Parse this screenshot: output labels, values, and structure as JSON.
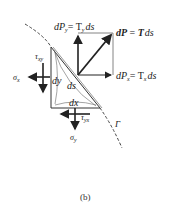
{
  "figure": {
    "caption": "(b)",
    "labels": {
      "dPy": "dP",
      "dPy_sub": "y",
      "dPy_rhs": "= T",
      "dPy_rhs_sub": "y",
      "dPy_ds": "ds",
      "dP_bold": "dP",
      "dP_eq": " = ",
      "T_bold": "T",
      "dP_ds": "ds",
      "dPx": "dP",
      "dPx_sub": "x",
      "dPx_rhs": "= T",
      "dPx_rhs_sub": "x",
      "dPx_ds": "ds",
      "tau_xy": "τ",
      "tau_xy_sub": "xy",
      "sigma_x": "σ",
      "sigma_x_sub": "x",
      "dy": "dy",
      "ds": "ds",
      "dx": "dx",
      "tau_yx": "τ",
      "tau_yx_sub": "yx",
      "sigma_y": "σ",
      "sigma_y_sub": "y",
      "boundary": "Γ"
    },
    "colors": {
      "line": "#222222",
      "thin": "#555555"
    }
  }
}
